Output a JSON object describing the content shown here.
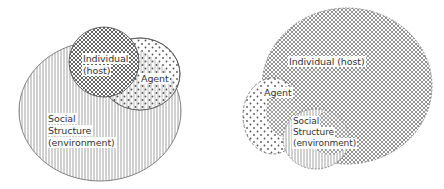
{
  "left_diagram": {
    "labels": {
      "individual_line1": "Individual",
      "individual_line2": "(host)",
      "agent": "Agent",
      "social_line1": "Social",
      "social_line2": "Structure",
      "social_line3": "(environment)"
    }
  },
  "right_diagram": {
    "labels": {
      "individual": "Individual (host)",
      "agent": "Agent",
      "social_line1": "Social",
      "social_line2": "Structure",
      "social_line3": "(environment)"
    }
  },
  "legend_patterns": {
    "individual": "crosshatch",
    "agent": "dots",
    "social_structure": "vertical-lines"
  },
  "colors": {
    "ink": "#555555",
    "background": "#ffffff"
  }
}
